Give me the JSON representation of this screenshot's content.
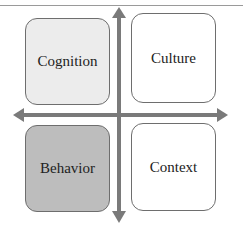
{
  "diagram": {
    "type": "quadrant",
    "axes": {
      "vertical": {
        "direction": "bidirectional"
      },
      "horizontal": {
        "direction": "bidirectional"
      },
      "color": "#7a7a7a"
    },
    "quadrants": [
      {
        "position": "top-left",
        "label": "Cognition",
        "fill": "#ececec"
      },
      {
        "position": "top-right",
        "label": "Culture",
        "fill": "#ffffff"
      },
      {
        "position": "bottom-left",
        "label": "Behavior",
        "fill": "#bdbdbd"
      },
      {
        "position": "bottom-right",
        "label": "Context",
        "fill": "#ffffff"
      }
    ]
  }
}
